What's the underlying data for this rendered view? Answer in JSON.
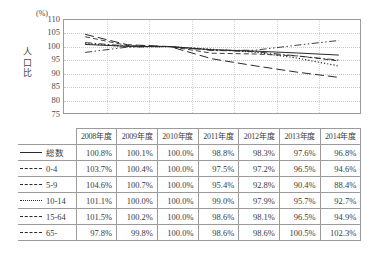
{
  "chart_data": {
    "type": "line",
    "title": "",
    "xlabel": "",
    "ylabel": "人口比",
    "unit_label": "(%)",
    "ylim": [
      75,
      110
    ],
    "yticks": [
      110,
      105,
      100,
      95,
      90,
      85,
      80,
      75
    ],
    "grid": true,
    "legend_position": "table-left-column",
    "categories": [
      "2008年度",
      "2009年度",
      "2010年度",
      "2011年度",
      "2012年度",
      "2013年度",
      "2014年度"
    ],
    "series": [
      {
        "name": "総数",
        "line_style": "solid",
        "values": [
          100.8,
          100.1,
          100.0,
          98.8,
          98.3,
          97.6,
          96.8
        ],
        "labels": [
          "100.8%",
          "100.1%",
          "100.0%",
          "98.8%",
          "98.3%",
          "97.6%",
          "96.8%"
        ]
      },
      {
        "name": "0-4",
        "line_style": "dashed",
        "values": [
          103.7,
          100.4,
          100.0,
          97.5,
          97.2,
          96.5,
          94.6
        ],
        "labels": [
          "103.7%",
          "100.4%",
          "100.0%",
          "97.5%",
          "97.2%",
          "96.5%",
          "94.6%"
        ]
      },
      {
        "name": "5-9",
        "line_style": "long-dash",
        "values": [
          104.6,
          100.7,
          100.0,
          95.4,
          92.8,
          90.4,
          88.4
        ],
        "labels": [
          "104.6%",
          "100.7%",
          "100.0%",
          "95.4%",
          "92.8%",
          "90.4%",
          "88.4%"
        ]
      },
      {
        "name": "10-14",
        "line_style": "dotted",
        "values": [
          101.1,
          100.0,
          100.0,
          99.0,
          97.9,
          95.7,
          92.7
        ],
        "labels": [
          "101.1%",
          "100.0%",
          "100.0%",
          "99.0%",
          "97.9%",
          "95.7%",
          "92.7%"
        ]
      },
      {
        "name": "15-64",
        "line_style": "dash-dot",
        "values": [
          101.5,
          100.2,
          100.0,
          98.6,
          98.1,
          96.5,
          94.9
        ],
        "labels": [
          "101.5%",
          "100.2%",
          "100.0%",
          "98.6%",
          "98.1%",
          "96.5%",
          "94.9%"
        ]
      },
      {
        "name": "65-",
        "line_style": "dash-dot-dot",
        "values": [
          97.8,
          99.8,
          100.0,
          98.6,
          98.6,
          100.5,
          102.3
        ],
        "labels": [
          "97.8%",
          "99.8%",
          "100.0%",
          "98.6%",
          "98.6%",
          "100.5%",
          "102.3%"
        ]
      }
    ]
  },
  "table": {
    "corner_label": "",
    "headers": [
      "2008年度",
      "2009年度",
      "2010年度",
      "2011年度",
      "2012年度",
      "2013年度",
      "2014年度"
    ],
    "rows": [
      {
        "name": "総数",
        "style": "sw-solid",
        "values": [
          "100.8%",
          "100.1%",
          "100.0%",
          "98.8%",
          "98.3%",
          "97.6%",
          "96.8%"
        ]
      },
      {
        "name": "0-4",
        "style": "sw-dash",
        "values": [
          "103.7%",
          "100.4%",
          "100.0%",
          "97.5%",
          "97.2%",
          "96.5%",
          "94.6%"
        ]
      },
      {
        "name": "5-9",
        "style": "sw-longdash",
        "values": [
          "104.6%",
          "100.7%",
          "100.0%",
          "95.4%",
          "92.8%",
          "90.4%",
          "88.4%"
        ]
      },
      {
        "name": "10-14",
        "style": "sw-dot",
        "values": [
          "101.1%",
          "100.0%",
          "100.0%",
          "99.0%",
          "97.9%",
          "95.7%",
          "92.7%"
        ]
      },
      {
        "name": "15-64",
        "style": "sw-dashdot",
        "values": [
          "101.5%",
          "100.2%",
          "100.0%",
          "98.6%",
          "98.1%",
          "96.5%",
          "94.9%"
        ]
      },
      {
        "name": "65-",
        "style": "sw-dashdot",
        "values": [
          "97.8%",
          "99.8%",
          "100.0%",
          "98.6%",
          "98.6%",
          "100.5%",
          "102.3%"
        ]
      }
    ]
  },
  "colors": {
    "line": "#2a2a2a",
    "border": "#9b9b9b",
    "grid": "#c9c9c9",
    "text": "#3a3a3a",
    "background": "#ffffff"
  }
}
